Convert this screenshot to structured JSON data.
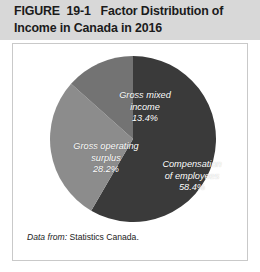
{
  "figure": {
    "number": "FIGURE  19-1",
    "title_text": "FIGURE  19-1   Factor Distribution of Income in Canada in 2016",
    "title_line1": "FIGURE  19-1   Factor Distribution of",
    "title_line2": "Income in Canada in 2016"
  },
  "source": {
    "lead": "Data from:",
    "body": " Statistics Canada.",
    "full": "Data from: Statistics Canada."
  },
  "labels": {
    "compensation": "Compensation\nof employees",
    "compensation_pct": "58.4%",
    "surplus": "Gross operating\nsurplus",
    "surplus_pct": "28.2%",
    "mixed": "Gross mixed\nincome",
    "mixed_pct": "13.4%"
  },
  "colors": {
    "header_band": "#d8d8d8",
    "panel_background": "#ffffff",
    "panel_border": "#c9c9c9",
    "compensation": "#3a3a3a",
    "surplus": "#8c8c8c",
    "mixed": "#737373",
    "label_text": "#ffffff",
    "title_text": "#1b1b1b"
  },
  "chart_data": {
    "type": "pie",
    "title": "FIGURE  19-1   Factor Distribution of Income in Canada in 2016",
    "xlabel": "",
    "ylabel": "",
    "unit": "percent",
    "legend": "none (labels inside slices)",
    "grid": false,
    "start_angle_deg": 0,
    "direction": "clockwise",
    "categories": [
      "Compensation of employees",
      "Gross operating surplus",
      "Gross mixed income"
    ],
    "values": [
      58.4,
      28.2,
      13.4
    ],
    "slices": [
      {
        "name": "Compensation of employees",
        "value": 58.4,
        "label": "Compensation of employees",
        "pct_label": "58.4%",
        "color": "#3a3a3a",
        "start_deg": 0,
        "end_deg": 210.24
      },
      {
        "name": "Gross operating surplus",
        "value": 28.2,
        "label": "Gross operating surplus",
        "pct_label": "28.2%",
        "color": "#8c8c8c",
        "start_deg": 210.24,
        "end_deg": 311.76
      },
      {
        "name": "Gross mixed income",
        "value": 13.4,
        "label": "Gross mixed income",
        "pct_label": "13.4%",
        "color": "#737373",
        "start_deg": 311.76,
        "end_deg": 360
      }
    ],
    "annotations": [
      "Data from: Statistics Canada."
    ]
  }
}
